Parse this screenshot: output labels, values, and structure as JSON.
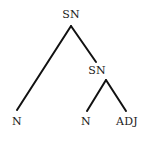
{
  "diagram": {
    "type": "syntax-tree",
    "line_color": "#111111",
    "nodes": [
      {
        "id": "root",
        "label": "SN",
        "x": 71,
        "y": 15
      },
      {
        "id": "sn2",
        "label": "SN",
        "x": 97,
        "y": 71
      },
      {
        "id": "n1",
        "label": "N",
        "x": 17,
        "y": 122
      },
      {
        "id": "n2",
        "label": "N",
        "x": 86,
        "y": 122
      },
      {
        "id": "adj",
        "label": "ADJ",
        "x": 127,
        "y": 122
      }
    ],
    "edges": [
      {
        "from": "root",
        "to": "n1"
      },
      {
        "from": "root",
        "to": "sn2"
      },
      {
        "from": "sn2",
        "to": "n2"
      },
      {
        "from": "sn2",
        "to": "adj"
      }
    ]
  }
}
